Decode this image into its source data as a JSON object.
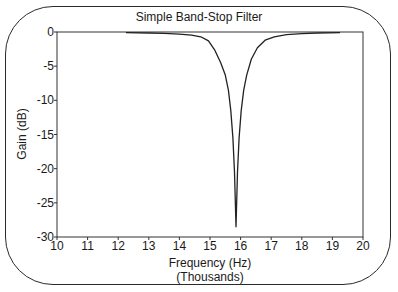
{
  "chart_data": {
    "type": "line",
    "title": "Simple Band-Stop Filter",
    "xlabel": "Frequency (Hz)",
    "xlabel_sub": "(Thousands)",
    "ylabel": "Gain (dB)",
    "xlim": [
      10,
      20
    ],
    "ylim": [
      -30,
      0
    ],
    "x_ticks": [
      10,
      11,
      12,
      13,
      14,
      15,
      16,
      17,
      18,
      19,
      20
    ],
    "y_ticks": [
      0,
      -5,
      -10,
      -15,
      -20,
      -25,
      -30
    ],
    "grid": false,
    "legend": null,
    "series": [
      {
        "name": "Gain",
        "x": [
          12.25,
          13.0,
          13.5,
          14.0,
          14.4,
          14.7,
          14.95,
          15.15,
          15.35,
          15.5,
          15.6,
          15.68,
          15.75,
          15.8,
          15.85,
          15.9,
          15.95,
          16.02,
          16.1,
          16.2,
          16.35,
          16.55,
          16.8,
          17.1,
          17.5,
          18.0,
          18.5,
          19.25
        ],
        "y": [
          -0.1,
          -0.15,
          -0.2,
          -0.3,
          -0.45,
          -0.7,
          -1.3,
          -2.6,
          -4.5,
          -6.3,
          -8.5,
          -11.5,
          -15.5,
          -20.5,
          -28.5,
          -20.5,
          -15.5,
          -11.5,
          -8.5,
          -6.3,
          -4.0,
          -2.3,
          -1.2,
          -0.7,
          -0.4,
          -0.25,
          -0.15,
          -0.1
        ]
      }
    ]
  }
}
